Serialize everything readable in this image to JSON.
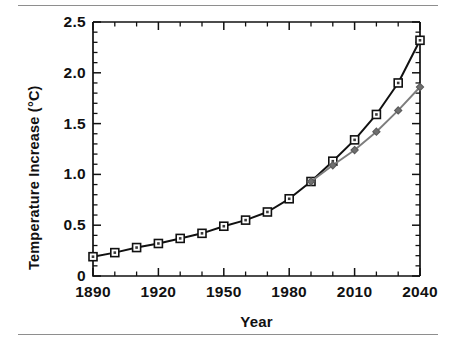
{
  "chart_data": {
    "type": "line",
    "title": "",
    "xlabel": "Year",
    "ylabel": "Temperature Increase (°C)",
    "xlim": [
      1890,
      2040
    ],
    "ylim": [
      0,
      2.5
    ],
    "grid": false,
    "legend": "none",
    "x_tick_labels": [
      "1890",
      "1920",
      "1950",
      "1980",
      "2010",
      "2040"
    ],
    "x_tick_values": [
      1890,
      1920,
      1950,
      1980,
      2010,
      2040
    ],
    "x_minor_tick_interval": 10,
    "y_tick_labels": [
      "0",
      "0.5",
      "1.0",
      "1.5",
      "2.0",
      "2.5"
    ],
    "y_tick_values": [
      0,
      0.5,
      1.0,
      1.5,
      2.0,
      2.5
    ],
    "y_minor_tick_interval": 0.1,
    "series": [
      {
        "name": "primary-scenario",
        "marker": "open-square",
        "color": "#111111",
        "x": [
          1890,
          1900,
          1910,
          1920,
          1930,
          1940,
          1950,
          1960,
          1970,
          1980,
          1990,
          2000,
          2010,
          2020,
          2030,
          2040
        ],
        "values": [
          0.19,
          0.23,
          0.28,
          0.32,
          0.37,
          0.42,
          0.49,
          0.55,
          0.63,
          0.76,
          0.93,
          1.13,
          1.34,
          1.59,
          1.9,
          2.32
        ]
      },
      {
        "name": "secondary-scenario",
        "marker": "filled-diamond",
        "color": "#6f6f6f",
        "x": [
          1990,
          2000,
          2010,
          2020,
          2030,
          2040
        ],
        "values": [
          0.93,
          1.09,
          1.24,
          1.42,
          1.63,
          1.86
        ]
      }
    ]
  },
  "figure": {
    "axis_color": "#111111",
    "rule_color": "#8e8e8e",
    "background": "#ffffff"
  }
}
